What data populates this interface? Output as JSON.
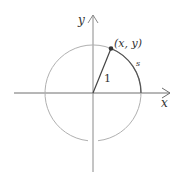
{
  "diagram": {
    "labels": {
      "y_axis": "y",
      "x_axis": "x",
      "point": "(x, y)",
      "radius": "1",
      "arc": "s"
    },
    "colors": {
      "axis": "#8a8a8a",
      "circle": "#b0b0b0",
      "radius_line": "#444444",
      "arc_highlight": "#555555",
      "point": "#333333",
      "text": "#333333"
    },
    "geometry": {
      "origin": [
        93,
        93
      ],
      "radius_px": 48,
      "point_angle_deg": 68
    }
  }
}
